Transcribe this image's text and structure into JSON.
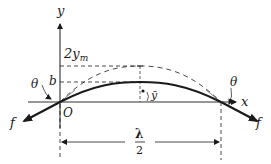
{
  "diagram": {
    "type": "string-wave-segment",
    "labels": {
      "y_axis": "y",
      "x_axis": "x",
      "origin": "O",
      "amplitude": "2y",
      "amplitude_sub": "m",
      "b_level": "b",
      "y_bar": "ȳ",
      "theta_left": "θ",
      "theta_right": "θ",
      "force_left": "f",
      "force_right": "f",
      "lambda": "λ",
      "half": "2"
    },
    "colors": {
      "ink": "#1a1a1a",
      "background": "#ffffff"
    }
  }
}
